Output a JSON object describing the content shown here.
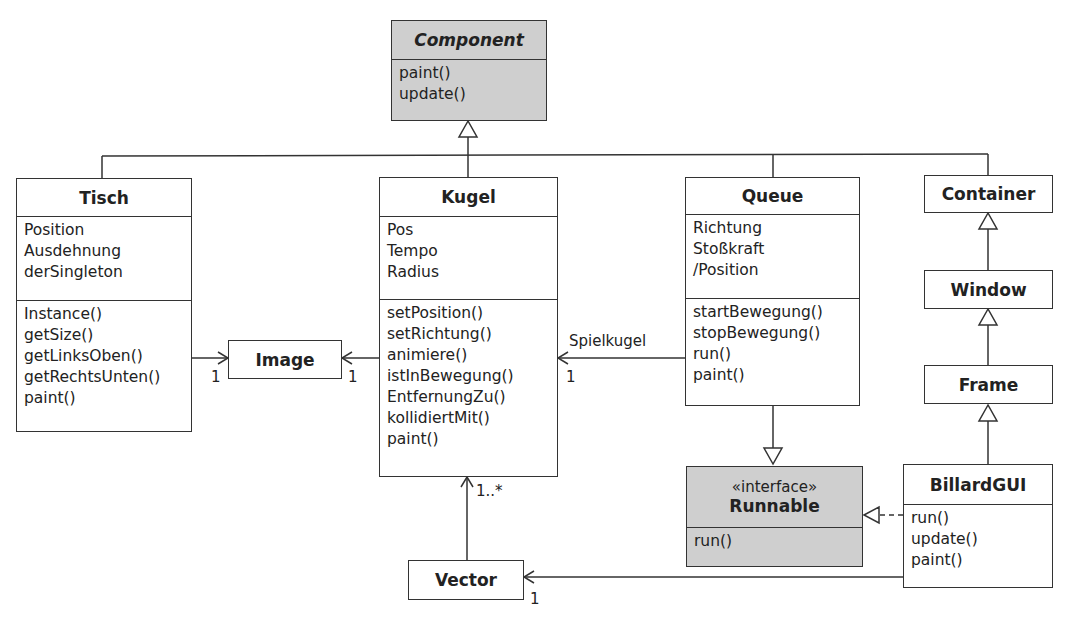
{
  "diagram": {
    "type": "UML class diagram",
    "classes": {
      "component": {
        "name": "Component",
        "attributes": [],
        "operations": [
          "paint()",
          "update()"
        ]
      },
      "tisch": {
        "name": "Tisch",
        "attributes": [
          "Position",
          "Ausdehnung",
          "derSingleton"
        ],
        "operations": [
          "Instance()",
          "getSize()",
          "getLinksOben()",
          "getRechtsUnten()",
          "paint()"
        ]
      },
      "kugel": {
        "name": "Kugel",
        "attributes": [
          "Pos",
          "Tempo",
          "Radius"
        ],
        "operations": [
          "setPosition()",
          "setRichtung()",
          "animiere()",
          "istInBewegung()",
          "EntfernungZu()",
          "kollidiertMit()",
          "paint()"
        ]
      },
      "queue": {
        "name": "Queue",
        "attributes": [
          "Richtung",
          "Stoßkraft",
          "/Position"
        ],
        "operations": [
          "startBewegung()",
          "stopBewegung()",
          "run()",
          "paint()"
        ]
      },
      "container": {
        "name": "Container"
      },
      "window": {
        "name": "Window"
      },
      "frame": {
        "name": "Frame"
      },
      "image": {
        "name": "Image"
      },
      "runnable": {
        "stereotype": "«interface»",
        "name": "Runnable",
        "operations": [
          "run()"
        ]
      },
      "billardgui": {
        "name": "BillardGUI",
        "operations": [
          "run()",
          "update()",
          "paint()"
        ]
      },
      "vector": {
        "name": "Vector"
      }
    },
    "relations": {
      "tisch_image": {
        "multiplicity": "1"
      },
      "kugel_image": {
        "multiplicity": "1"
      },
      "queue_kugel": {
        "role": "Spielkugel",
        "multiplicity": "1"
      },
      "vector_kugel": {
        "multiplicity": "1..*"
      },
      "billardgui_vector": {
        "multiplicity": "1"
      }
    },
    "colors": {
      "line": "#333333",
      "abstract_fill": "#cfcfcf",
      "class_fill": "#ffffff"
    }
  }
}
